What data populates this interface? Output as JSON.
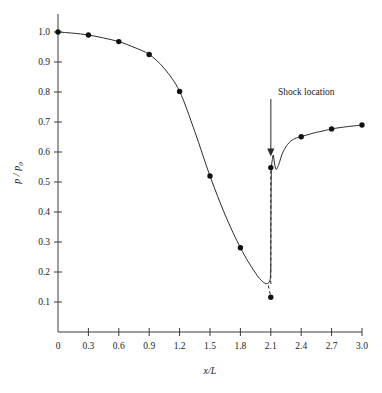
{
  "chart_data": {
    "type": "line",
    "title": "",
    "xlabel": "x/L",
    "ylabel": "p / p0",
    "ylabel_main": "p / p",
    "ylabel_sub": "0",
    "xlim": [
      0,
      3.0
    ],
    "ylim": [
      0,
      1.0
    ],
    "grid": false,
    "legend": null,
    "x_ticks": [
      "0",
      "0.3",
      "0.6",
      "0.9",
      "1.2",
      "1.5",
      "1.8",
      "2.1",
      "2.4",
      "2.7",
      "3.0"
    ],
    "x_tick_values": [
      0,
      0.3,
      0.6,
      0.9,
      1.2,
      1.5,
      1.8,
      2.1,
      2.4,
      2.7,
      3.0
    ],
    "y_ticks": [
      "0.1",
      "0.2",
      "0.3",
      "0.4",
      "0.5",
      "0.6",
      "0.7",
      "0.8",
      "0.9",
      "1.0"
    ],
    "y_tick_values": [
      0.1,
      0.2,
      0.3,
      0.4,
      0.5,
      0.6,
      0.7,
      0.8,
      0.9,
      1.0
    ],
    "series": [
      {
        "name": "markers",
        "style": "points",
        "x": [
          0.0,
          0.3,
          0.6,
          0.9,
          1.2,
          1.5,
          1.8,
          2.1,
          2.1,
          2.4,
          2.7,
          3.0
        ],
        "y": [
          1.0,
          0.99,
          0.968,
          0.925,
          0.802,
          0.52,
          0.281,
          0.548,
          0.116,
          0.651,
          0.677,
          0.69
        ]
      },
      {
        "name": "pre-shock solid curve",
        "style": "solid",
        "x": [
          0.0,
          0.15,
          0.3,
          0.45,
          0.6,
          0.75,
          0.9,
          1.05,
          1.2,
          1.35,
          1.5,
          1.65,
          1.8,
          1.95,
          2.04,
          2.09,
          2.1
        ],
        "y": [
          1.0,
          0.996,
          0.99,
          0.98,
          0.968,
          0.949,
          0.925,
          0.878,
          0.802,
          0.668,
          0.52,
          0.39,
          0.281,
          0.196,
          0.163,
          0.17,
          0.213
        ]
      },
      {
        "name": "shock vertical rise",
        "style": "solid",
        "x": [
          2.1,
          2.102,
          2.105
        ],
        "y": [
          0.213,
          0.42,
          0.548
        ]
      },
      {
        "name": "post-shock oscillation and recovery",
        "style": "solid",
        "x": [
          2.105,
          2.115,
          2.125,
          2.135,
          2.15,
          2.165,
          2.185,
          2.22,
          2.28,
          2.34,
          2.4,
          2.52,
          2.64,
          2.7,
          2.82,
          3.0
        ],
        "y": [
          0.548,
          0.575,
          0.59,
          0.566,
          0.543,
          0.548,
          0.565,
          0.6,
          0.631,
          0.645,
          0.651,
          0.663,
          0.672,
          0.677,
          0.683,
          0.69
        ]
      },
      {
        "name": "shock dashed discontinuity",
        "style": "dashed",
        "x": [
          2.1,
          2.1
        ],
        "y": [
          0.16,
          0.548
        ]
      },
      {
        "name": "dashed lower tail",
        "style": "dashed",
        "x": [
          2.075,
          2.1
        ],
        "y": [
          0.155,
          0.118
        ]
      }
    ],
    "annotations": [
      {
        "text": "Shock location",
        "type": "arrow-label",
        "x": 2.1,
        "y": 0.585,
        "label_x": 2.17,
        "label_y": 0.79
      }
    ]
  },
  "colors": {
    "curve": "#2b2b2b",
    "axis": "#3a3a3a",
    "marker": "#111111",
    "arrow": "#5c5c5c",
    "background": "#ffffff"
  }
}
